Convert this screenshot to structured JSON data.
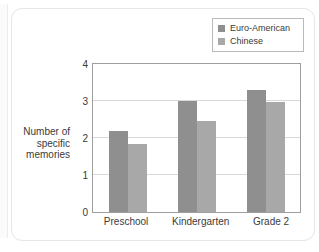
{
  "chart_data": {
    "type": "bar",
    "title": "",
    "xlabel": "",
    "ylabel": "Number of specific memories",
    "ylabel_lines": [
      "Number of",
      "specific",
      "memories"
    ],
    "categories": [
      "Preschool",
      "Kindergarten",
      "Grade 2"
    ],
    "series": [
      {
        "name": "Euro-American",
        "values": [
          2.2,
          3.0,
          3.3
        ],
        "color": "#8f8f8f"
      },
      {
        "name": "Chinese",
        "values": [
          1.85,
          2.45,
          2.98
        ],
        "color": "#a8a8a8"
      }
    ],
    "ylim": [
      0,
      4
    ],
    "yticks": [
      0,
      1,
      2,
      3,
      4
    ],
    "ytick_labels": [
      "0",
      "1",
      "2",
      "3",
      "4"
    ],
    "grid": true,
    "grid_axis": "y",
    "legend_position": "top-right",
    "frame": true
  },
  "colors": {
    "euro_american": "#8f8f8f",
    "chinese": "#a8a8a8",
    "frame": "#9e9e9e",
    "grid": "#d8d8d8",
    "text": "#3a3a3a",
    "card_border": "#e6e6e6"
  }
}
